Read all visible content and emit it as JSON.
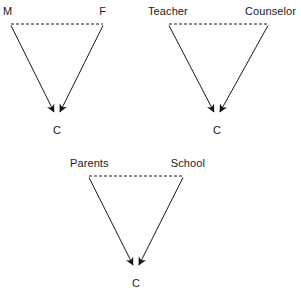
{
  "figure": {
    "type": "path-diagram",
    "background_color": "#ffffff",
    "stroke_color": "#1a1a1a"
  },
  "triangles": [
    {
      "id": "triangle-mf",
      "left_label": "M",
      "right_label": "F",
      "child_label": "C",
      "left_x": 11,
      "right_x": 103,
      "top_y": 24,
      "apex_x": 57,
      "apex_y": 117,
      "left_label_x": 3,
      "left_label_y": 5,
      "right_label_x": 106,
      "right_label_y": 5,
      "child_label_x": 57,
      "child_label_y": 124
    },
    {
      "id": "triangle-teacher-counselor",
      "left_label": "Teacher",
      "right_label": "Counselor",
      "child_label": "C",
      "left_x": 169,
      "right_x": 268,
      "top_y": 24,
      "apex_x": 217,
      "apex_y": 117,
      "left_label_x": 148,
      "left_label_y": 5,
      "right_label_x": 296,
      "right_label_y": 5,
      "child_label_x": 217,
      "child_label_y": 124
    },
    {
      "id": "triangle-parents-school",
      "left_label": "Parents",
      "right_label": "School",
      "child_label": "C",
      "left_x": 89,
      "right_x": 183,
      "top_y": 176,
      "apex_x": 136,
      "apex_y": 270,
      "left_label_x": 70,
      "left_label_y": 157,
      "right_label_x": 205,
      "right_label_y": 157,
      "child_label_x": 136,
      "child_label_y": 277
    }
  ],
  "line_styles": {
    "correlation_line": "dashed",
    "causal_arrow": "solid-with-arrowhead",
    "stroke_width": 1,
    "dash_pattern": "3 2"
  }
}
